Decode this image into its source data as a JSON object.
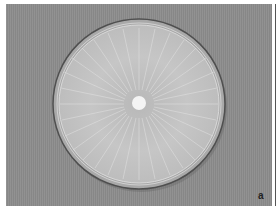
{
  "image": {
    "subject": "petri-dish-fungal-culture",
    "panel_label": "a",
    "colors": {
      "background": "#8c8c8c",
      "dish_rim": "#5a5a5a",
      "mycelium": "#c8c8c8",
      "inoculum_plug": "#f4f4f4",
      "frame": "#ffffff"
    }
  }
}
